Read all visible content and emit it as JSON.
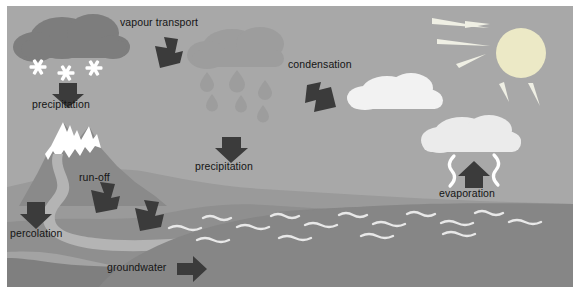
{
  "diagram": {
    "background_color": "#a8a8a8",
    "frame_color": "#ffffff"
  },
  "labels": {
    "vapour_transport": "vapour transport",
    "precipitation_snow": "precipitation",
    "precipitation_rain": "precipitation",
    "condensation": "condensation",
    "evaporation": "evaporation",
    "run_off": "run-off",
    "percolation": "percolation",
    "groundwater": "groundwater"
  },
  "colors": {
    "sky": "#a8a8a8",
    "snow_cloud": "#7d7d7d",
    "rain_cloud": "#9d9d9d",
    "white_cloud": "#ebebeb",
    "bright_cloud": "#f2f2f2",
    "arrow": "#3b3b3b",
    "snowflake": "#ffffff",
    "sun": "#ece9c6",
    "sun_ray": "#efefe4",
    "mountain": "#8a8a8a",
    "snowcap": "#ffffff",
    "land_far": "#9a9a9a",
    "land_mid": "#8f8f8f",
    "land_near": "#7f7f7f",
    "beach": "#a3a3a3",
    "river": "#b4b4b4",
    "ocean": "#868686",
    "wave": "#e8e8e8",
    "text": "#141414"
  },
  "elements": {
    "clouds": [
      {
        "name": "snow-cloud",
        "kind": "dark"
      },
      {
        "name": "rain-cloud",
        "kind": "mid"
      },
      {
        "name": "condensation-cloud",
        "kind": "white"
      },
      {
        "name": "evaporation-cloud",
        "kind": "white"
      }
    ],
    "snowflake_count": 3,
    "raindrop_count": 6,
    "sun_ray_count": 5,
    "wave_rows": 3,
    "run_off_arrows": 2
  },
  "icons": {
    "arrow_down": "arrow-down-icon",
    "arrow_up": "arrow-up-icon",
    "arrow_right": "arrow-right-icon",
    "arrow_down_left": "arrow-down-left-icon",
    "arrow_down_right": "arrow-down-right-icon",
    "snowflake": "snowflake-icon",
    "raindrop": "raindrop-icon",
    "sun": "sun-icon",
    "wave": "wave-icon",
    "vapour_squiggle": "vapour-squiggle-icon"
  }
}
